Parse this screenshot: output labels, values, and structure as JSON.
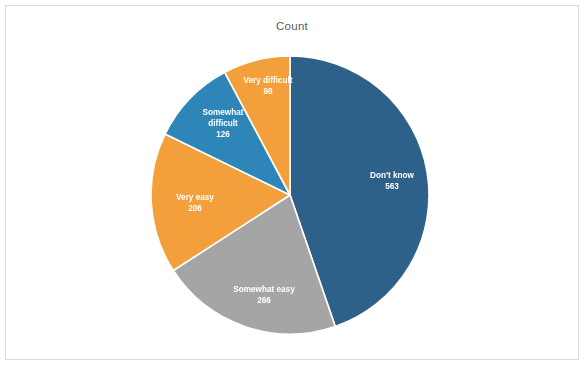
{
  "chart": {
    "title": "Count"
  },
  "chart_data": {
    "type": "pie",
    "title": "Count",
    "xlabel": "",
    "ylabel": "",
    "total": 1259,
    "start_angle_deg": 0,
    "direction": "clockwise",
    "legend": "none",
    "labels_position": "inside-slice",
    "categories": [
      "Don't know",
      "Somewhat easy",
      "Very easy",
      "Somewhat difficult",
      "Very difficult"
    ],
    "values": [
      563,
      266,
      206,
      126,
      98
    ],
    "colors": [
      "#2E6189",
      "#A5A5A5",
      "#F3A03C",
      "#2E86B8",
      "#F3A03C"
    ],
    "slices": [
      {
        "label": "Don't know",
        "label_line1": "Don't know",
        "label_line2": "",
        "value": 563,
        "value_text": "563",
        "color": "#2E6189",
        "percent": 44.7,
        "start_deg": 0,
        "end_deg": 161.0,
        "label_x": 392,
        "label_y": 178,
        "value_x": 392,
        "value_y": 189
      },
      {
        "label": "Somewhat easy",
        "label_line1": "Somewhat easy",
        "label_line2": "",
        "value": 266,
        "value_text": "266",
        "color": "#A5A5A5",
        "percent": 21.1,
        "start_deg": 161.0,
        "end_deg": 237.1,
        "label_x": 264,
        "label_y": 292,
        "value_x": 264,
        "value_y": 303
      },
      {
        "label": "Very easy",
        "label_line1": "Very easy",
        "label_line2": "",
        "value": 206,
        "value_text": "206",
        "color": "#F3A03C",
        "percent": 16.4,
        "start_deg": 237.1,
        "end_deg": 296.0,
        "label_x": 195,
        "label_y": 200,
        "value_x": 195,
        "value_y": 211
      },
      {
        "label": "Somewhat difficult",
        "label_line1": "Somewhat",
        "label_line2": "difficult",
        "value": 126,
        "value_text": "126",
        "color": "#2E86B8",
        "percent": 10.0,
        "start_deg": 296.0,
        "end_deg": 332.0,
        "label_x": 223,
        "label_y": 115,
        "label2_x": 223,
        "label2_y": 126,
        "value_x": 223,
        "value_y": 137
      },
      {
        "label": "Very difficult",
        "label_line1": "Very difficult",
        "label_line2": "",
        "value": 98,
        "value_text": "98",
        "color": "#F3A03C",
        "percent": 7.8,
        "start_deg": 332.0,
        "end_deg": 360.0,
        "label_x": 268,
        "label_y": 83,
        "value_x": 268,
        "value_y": 94
      }
    ],
    "geometry": {
      "center_x": 290,
      "center_y": 195,
      "radius": 139
    }
  }
}
